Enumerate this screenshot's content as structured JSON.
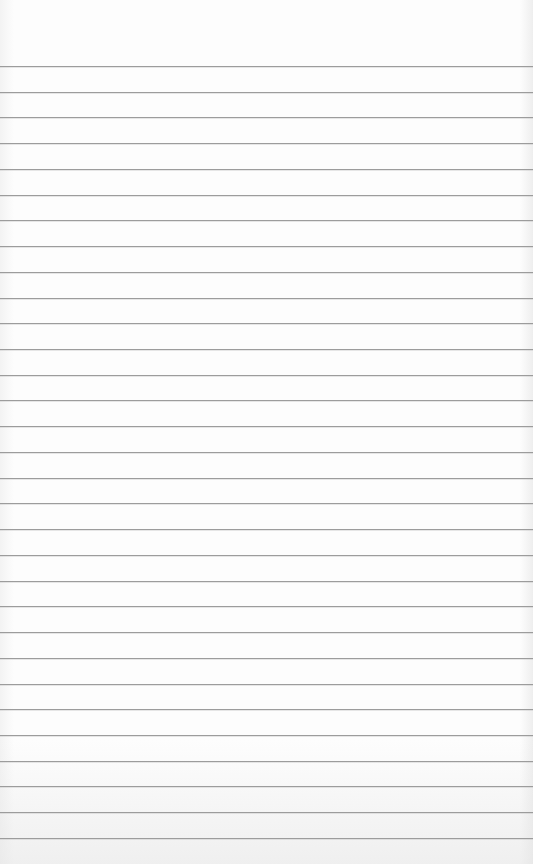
{
  "page": {
    "type": "ruled-paper",
    "background_color": "#fdfdfd",
    "rule_color": "#9c9c9c",
    "rule_count": 31,
    "first_rule_y": 66,
    "rule_spacing": 25.73,
    "text": ""
  }
}
